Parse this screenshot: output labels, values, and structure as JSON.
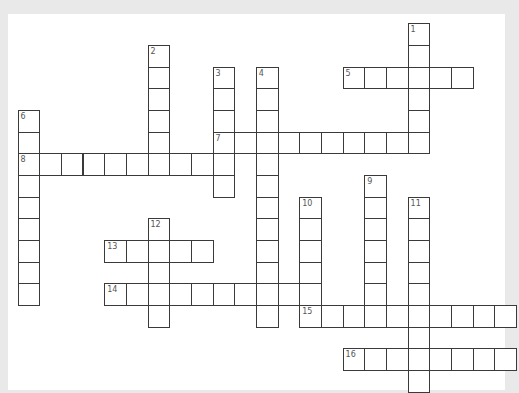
{
  "puzzle": {
    "grid": {
      "origin_x": 18,
      "origin_y": 23.7,
      "cell_size": 21.67
    },
    "words": [
      {
        "number": "1",
        "direction": "down",
        "col": 18,
        "row": 0,
        "length": 6
      },
      {
        "number": "2",
        "direction": "down",
        "col": 6,
        "row": 1,
        "length": 6
      },
      {
        "number": "3",
        "direction": "down",
        "col": 9,
        "row": 2,
        "length": 6
      },
      {
        "number": "4",
        "direction": "down",
        "col": 11,
        "row": 2,
        "length": 12
      },
      {
        "number": "5",
        "direction": "across",
        "col": 15,
        "row": 2,
        "length": 6
      },
      {
        "number": "6",
        "direction": "down",
        "col": 0,
        "row": 4,
        "length": 9
      },
      {
        "number": "7",
        "direction": "across",
        "col": 9,
        "row": 5,
        "length": 10
      },
      {
        "number": "8",
        "direction": "across",
        "col": 0,
        "row": 6,
        "length": 10
      },
      {
        "number": "9",
        "direction": "down",
        "col": 16,
        "row": 7,
        "length": 7
      },
      {
        "number": "10",
        "direction": "down",
        "col": 13,
        "row": 8,
        "length": 6
      },
      {
        "number": "11",
        "direction": "down",
        "col": 18,
        "row": 8,
        "length": 9
      },
      {
        "number": "12",
        "direction": "down",
        "col": 6,
        "row": 9,
        "length": 5
      },
      {
        "number": "13",
        "direction": "across",
        "col": 4,
        "row": 10,
        "length": 5
      },
      {
        "number": "14",
        "direction": "across",
        "col": 4,
        "row": 12,
        "length": 10
      },
      {
        "number": "15",
        "direction": "across",
        "col": 13,
        "row": 13,
        "length": 10
      },
      {
        "number": "16",
        "direction": "across",
        "col": 15,
        "row": 15,
        "length": 8
      }
    ]
  }
}
